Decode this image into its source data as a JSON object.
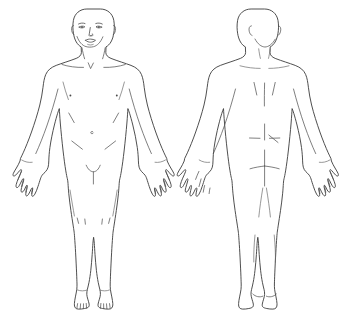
{
  "page": {
    "background_color": "#ffffff",
    "width": 342,
    "height": 335
  },
  "style": {
    "outline_color": "#3b3b3b",
    "detail_color": "#545454",
    "fill_color": "#ffffff",
    "line_width": "0.9"
  },
  "figures": [
    {
      "id": "anterior",
      "view_label": "Front view",
      "caption": "",
      "orientation": "anterior",
      "parts": [
        "head",
        "face",
        "eyes",
        "eyebrows",
        "nose",
        "mouth",
        "ears",
        "neck",
        "clavicles",
        "shoulders",
        "chest",
        "nipples",
        "abdomen",
        "navel",
        "groin",
        "arms",
        "elbows",
        "forearms",
        "hands",
        "fingers",
        "thighs",
        "knees",
        "shins",
        "ankles",
        "feet",
        "toes"
      ]
    },
    {
      "id": "posterior",
      "view_label": "Back view",
      "caption": "",
      "orientation": "posterior",
      "parts": [
        "head-back",
        "ears",
        "neck",
        "shoulders",
        "scapulae",
        "spine",
        "back",
        "lower-back",
        "buttocks",
        "gluteal-cleft",
        "arms",
        "elbows",
        "forearms",
        "hands",
        "fingers",
        "hamstrings",
        "knees",
        "calves",
        "ankles",
        "heels"
      ]
    }
  ],
  "labels": {
    "front_caption": "",
    "back_caption": ""
  }
}
